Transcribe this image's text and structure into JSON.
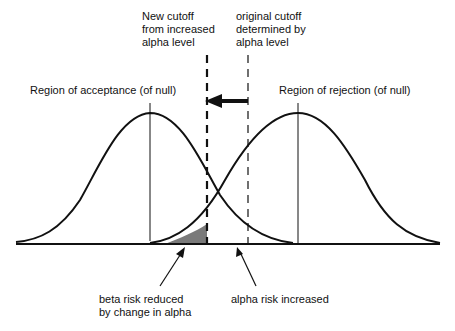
{
  "labels": {
    "new_cutoff": "New cutoff\nfrom increased\nalpha level",
    "original_cutoff": "original cutoff\ndetermined by\nalpha level",
    "region_acceptance": "Region of acceptance (of null)",
    "region_rejection": "Region of rejection (of null)",
    "beta_risk": "beta risk reduced\nby change in alpha",
    "alpha_risk": "alpha risk increased"
  },
  "diagram": {
    "type": "two overlapping normal distributions with cutoff lines",
    "curves": [
      {
        "name": "null-distribution",
        "mean_x": 150,
        "label_ref": "region_acceptance"
      },
      {
        "name": "alternative-distribution",
        "mean_x": 298,
        "label_ref": "region_rejection"
      }
    ],
    "cutoffs": [
      {
        "name": "new-cutoff",
        "x": 207,
        "style": "dashed-bold"
      },
      {
        "name": "original-cutoff",
        "x": 248,
        "style": "dashed-thin"
      }
    ],
    "arrow": {
      "from_x": 248,
      "to_x": 207,
      "direction": "left"
    },
    "shaded_region": {
      "name": "beta-risk-reduced",
      "color": "#7a7a7a"
    }
  }
}
